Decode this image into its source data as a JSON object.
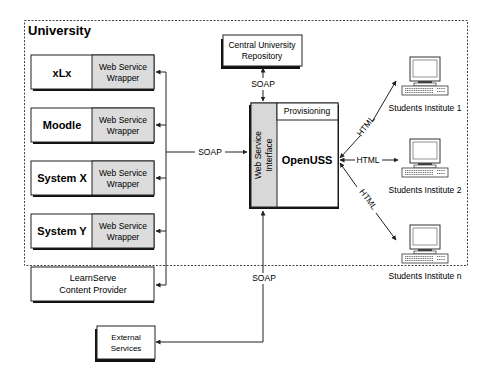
{
  "diagram": {
    "university_label": "University",
    "systems": [
      {
        "name": "xLx",
        "wrapper": [
          "Web Service",
          "Wrapper"
        ]
      },
      {
        "name": "Moodle",
        "wrapper": [
          "Web Service",
          "Wrapper"
        ]
      },
      {
        "name": "System X",
        "wrapper": [
          "Web Service",
          "Wrapper"
        ]
      },
      {
        "name": "System Y",
        "wrapper": [
          "Web Service",
          "Wrapper"
        ]
      }
    ],
    "content_provider": [
      "LearnServe",
      "Content Provider"
    ],
    "central_repository": [
      "Central University",
      "Repository"
    ],
    "external_services": [
      "External",
      "Services"
    ],
    "openuss": {
      "name": "OpenUSS",
      "provisioning": "Provisioning",
      "interface": [
        "Web Service",
        "Interface"
      ]
    },
    "connections": {
      "soap_left": "SOAP",
      "soap_top": "SOAP",
      "soap_bottom": "SOAP",
      "html_1": "HTML",
      "html_2": "HTML",
      "html_n": "HTML"
    },
    "clients": [
      "Students Institute 1",
      "Students Institute 2",
      "Students Institute n"
    ],
    "colors": {
      "wrapper_fill": "#dcdcdc",
      "interface_fill": "#d8d8d8",
      "line": "#222222"
    }
  }
}
